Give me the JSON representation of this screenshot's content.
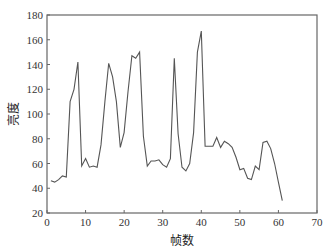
{
  "chart_data": {
    "type": "line",
    "title": "",
    "xlabel": "帧数",
    "ylabel": "亮度",
    "xlim": [
      0,
      70
    ],
    "ylim": [
      20,
      180
    ],
    "xticks": [
      0,
      10,
      20,
      30,
      40,
      50,
      60,
      70
    ],
    "yticks": [
      20,
      40,
      60,
      80,
      100,
      120,
      140,
      160,
      180
    ],
    "grid": false,
    "legend": null,
    "series": [
      {
        "name": "亮度",
        "color": "#555555",
        "x": [
          1,
          2,
          3,
          4,
          5,
          6,
          7,
          8,
          9,
          10,
          11,
          12,
          13,
          14,
          15,
          16,
          17,
          18,
          19,
          20,
          21,
          22,
          23,
          24,
          25,
          26,
          27,
          28,
          29,
          30,
          31,
          32,
          33,
          34,
          35,
          36,
          37,
          38,
          39,
          40,
          41,
          42,
          43,
          44,
          45,
          46,
          47,
          48,
          49,
          50,
          51,
          52,
          53,
          54,
          55,
          56,
          57,
          58,
          59,
          60,
          61
        ],
        "values": [
          46,
          45,
          47,
          50,
          49,
          110,
          120,
          142,
          58,
          64,
          57,
          58,
          57,
          75,
          110,
          141,
          130,
          110,
          73,
          85,
          118,
          147,
          145,
          150,
          82,
          58,
          62,
          62,
          63,
          59,
          57,
          64,
          145,
          84,
          57,
          54,
          60,
          85,
          150,
          167,
          74,
          74,
          74,
          81,
          73,
          78,
          76,
          73,
          65,
          55,
          56,
          48,
          47,
          58,
          55,
          77,
          78,
          72,
          60,
          45,
          30
        ]
      }
    ]
  }
}
